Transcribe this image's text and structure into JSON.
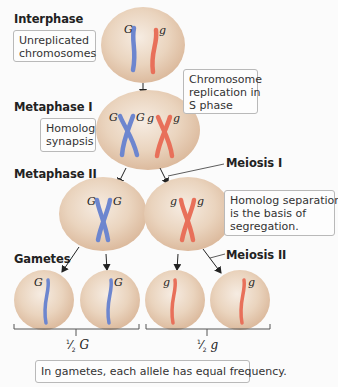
{
  "stages": {
    "interphase": "Interphase",
    "metaphase1": "Metaphase I",
    "metaphase2": "Metaphase II",
    "gametes": "Gametes"
  },
  "divisions": {
    "meiosis1": "Meiosis I",
    "meiosis2": "Meiosis II"
  },
  "notes": {
    "unreplicated": [
      "Unreplicated",
      "chromosomes"
    ],
    "replication": [
      "Chromosome",
      "replication in",
      "S phase"
    ],
    "synapsis": [
      "Homolog",
      "synapsis"
    ],
    "separation": [
      "Homolog separation",
      "is the basis of",
      "segregation."
    ],
    "frequency": "In gametes, each allele has equal frequency."
  },
  "alleles": {
    "dominant": "G",
    "recessive": "g"
  },
  "fractions": {
    "left": {
      "num": "1",
      "den": "2",
      "allele": "G"
    },
    "right": {
      "num": "1",
      "den": "2",
      "allele": "g"
    }
  },
  "colors": {
    "cell_fill": "#e8cfb6",
    "cell_edge": "#d7b89b",
    "dominant_chromosome": "#6d86cf",
    "recessive_chromosome": "#e8705a",
    "background": "#fbfbfb"
  }
}
